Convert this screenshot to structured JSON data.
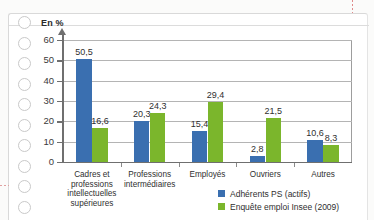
{
  "page": {
    "media": "scanned-book-page",
    "ring_holes_count": 10,
    "crop_marks": true
  },
  "chart_data": {
    "type": "bar",
    "title": "",
    "ylabel": "En %",
    "xlabel": "",
    "ylim": [
      0,
      60
    ],
    "yticks": [
      "0",
      "10",
      "20",
      "30",
      "40",
      "50",
      "60"
    ],
    "grid": true,
    "legend_position": "bottom-right",
    "categories": [
      "Cadres et professions intellectuelles supérieures",
      "Professions intermédiaires",
      "Employés",
      "Ouvriers",
      "Autres"
    ],
    "category_lines": [
      [
        "Cadres et",
        "professions",
        "intellectuelles",
        "supérieures"
      ],
      [
        "Professions",
        "intermédiaires"
      ],
      [
        "Employés"
      ],
      [
        "Ouvriers"
      ],
      [
        "Autres"
      ]
    ],
    "series": [
      {
        "name": "Adhérents PS (actifs)",
        "color": "#3a6fb0",
        "values": [
          50.5,
          20.3,
          15.4,
          2.8,
          10.6
        ],
        "labels": [
          "50,5",
          "20,3",
          "15,4",
          "2,8",
          "10,6"
        ]
      },
      {
        "name": "Enquête emploi Insee (2009)",
        "color": "#7bb62c",
        "values": [
          16.6,
          24.3,
          29.4,
          21.5,
          8.3
        ],
        "labels": [
          "16,6",
          "24,3",
          "29,4",
          "21,5",
          "8,3"
        ]
      }
    ]
  },
  "colors": {
    "series_blue": "#3a6fb0",
    "series_green": "#7bb62c",
    "axis": "#6f6f6f",
    "grid": "#b4b4b4",
    "text": "#2f2f2f",
    "paper": "#ffffff"
  }
}
